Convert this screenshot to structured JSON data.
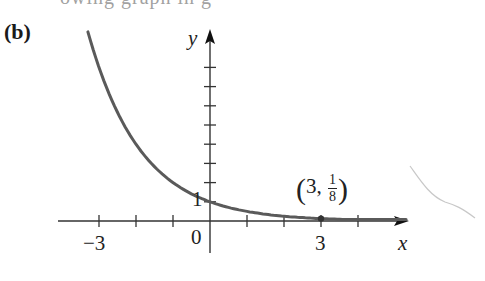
{
  "header_fragment": "owing graph in g",
  "panel_label": "(b)",
  "colors": {
    "curve": "#5a5a5a",
    "axes": "#333333",
    "stray_mark": "#c8c8c8"
  },
  "chart_data": {
    "type": "line",
    "title": "",
    "function": "y = (1/2)^x",
    "xlabel": "x",
    "ylabel": "y",
    "xlim": [
      -3.4,
      5.3
    ],
    "ylim": [
      -1.6,
      9.5
    ],
    "grid": false,
    "legend": null,
    "x_ticks": [
      -3,
      -2,
      -1,
      0,
      1,
      2,
      3,
      4
    ],
    "x_tick_labels": [
      {
        "value": -3,
        "label": "−3"
      },
      {
        "value": 0,
        "label": "0"
      },
      {
        "value": 3,
        "label": "3"
      }
    ],
    "y_ticks": [
      1,
      2,
      3,
      4,
      5,
      6,
      7,
      8
    ],
    "y_tick_labels": [
      {
        "value": 1,
        "label": "1"
      }
    ],
    "series": [
      {
        "name": "y = (1/2)^x",
        "x": [
          -3.3,
          -3,
          -2.5,
          -2,
          -1.5,
          -1,
          -0.5,
          0,
          0.5,
          1,
          1.5,
          2,
          2.5,
          3,
          3.5,
          4,
          4.5,
          5,
          5.3
        ],
        "y": [
          9.85,
          8,
          5.66,
          4,
          2.83,
          2,
          1.41,
          1,
          0.71,
          0.5,
          0.35,
          0.25,
          0.18,
          0.125,
          0.088,
          0.0625,
          0.044,
          0.031,
          0.025
        ]
      }
    ],
    "annotations": [
      {
        "point": [
          3,
          0.125
        ],
        "label_text": "(3, 1/8)",
        "label_whole": "3,",
        "label_num": "1",
        "label_den": "8",
        "marker": "dot"
      },
      {
        "point": [
          0,
          1
        ],
        "label_text": "1"
      }
    ]
  }
}
